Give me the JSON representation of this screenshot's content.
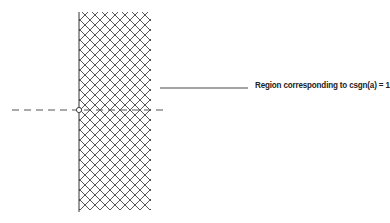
{
  "diagram": {
    "annotation": {
      "label": "Region corresponding to csgn(a) = 1"
    },
    "elements": {
      "axis": "imaginary axis (vertical)",
      "real_axis": "dashed horizontal line",
      "origin": "open circle at origin",
      "region": "cross-hatched right half-plane"
    }
  }
}
